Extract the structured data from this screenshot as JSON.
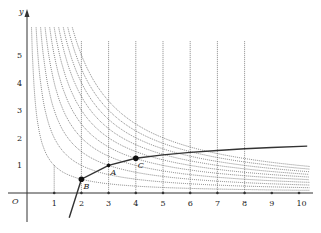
{
  "figure": {
    "axes": {
      "x_label": "x",
      "y_label": "y",
      "origin_label": "O",
      "x_ticks": [
        "1",
        "2",
        "3",
        "4",
        "5",
        "6",
        "7",
        "8",
        "9",
        "10"
      ],
      "y_ticks": [
        "1",
        "2",
        "3",
        "4",
        "5"
      ]
    },
    "points": [
      {
        "label": "B",
        "x": 2,
        "y": 0.5
      },
      {
        "label": "A",
        "x": 3,
        "y": 1.0
      },
      {
        "label": "C",
        "x": 4,
        "y": 1.26
      }
    ],
    "colors": {
      "curve": "#333333",
      "dotted": "#555555",
      "axis": "#333333"
    }
  },
  "chart_data": {
    "type": "line",
    "title": "",
    "xlabel": "x",
    "ylabel": "y",
    "xlim": [
      0,
      10.5
    ],
    "ylim": [
      -1,
      6
    ],
    "grid": false,
    "series": [
      {
        "name": "increasing log-like curve (solid)",
        "x": [
          1.55,
          2,
          3,
          4,
          5,
          6,
          7,
          8,
          9,
          10.3
        ],
        "y": [
          -0.9,
          0.5,
          1.0,
          1.26,
          1.38,
          1.47,
          1.54,
          1.6,
          1.65,
          1.7
        ]
      },
      {
        "name": "hyperbolae y=k/x (dotted), k=1..10",
        "k": [
          1,
          2,
          3,
          4,
          5,
          6,
          7,
          8,
          9,
          10
        ]
      },
      {
        "name": "vertical dotted lines",
        "x": [
          1,
          2,
          3,
          4,
          5,
          6,
          7,
          8
        ]
      }
    ],
    "annotations": [
      "O",
      "A",
      "B",
      "C"
    ]
  }
}
